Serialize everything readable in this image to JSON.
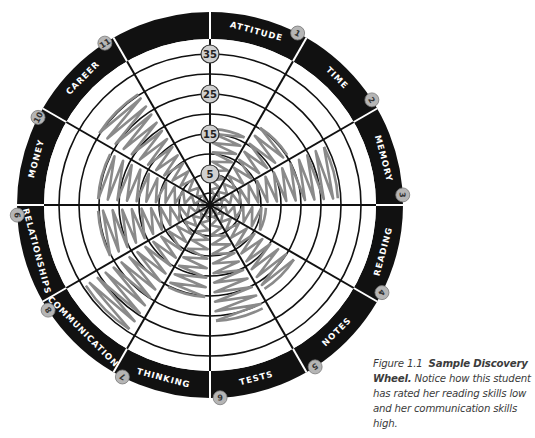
{
  "wheel": {
    "center": [
      210,
      205
    ],
    "outer_radius": 193,
    "band_inner_radius": 166,
    "ring_radii": [
      12,
      31,
      51,
      71,
      91,
      111,
      131,
      151
    ],
    "scale_labels": [
      {
        "value": "5",
        "r": 31
      },
      {
        "value": "15",
        "r": 71
      },
      {
        "value": "25",
        "r": 111
      },
      {
        "value": "35",
        "r": 151
      }
    ],
    "scribble_color": "#8a8a8a",
    "segments": [
      {
        "number": "1",
        "label": "ATTITUDE",
        "rating": 16
      },
      {
        "number": "2",
        "label": "TIME",
        "rating": 20
      },
      {
        "number": "3",
        "label": "MEMORY",
        "rating": 29
      },
      {
        "number": "4",
        "label": "READING",
        "rating": 11
      },
      {
        "number": "5",
        "label": "NOTES",
        "rating": 22
      },
      {
        "number": "6",
        "label": "TESTS",
        "rating": 26
      },
      {
        "number": "7",
        "label": "THINKING",
        "rating": 20
      },
      {
        "number": "8",
        "label": "COMMUNICATION",
        "rating": 34
      },
      {
        "number": "9",
        "label": "RELATIONSHIPS",
        "rating": 25
      },
      {
        "number": "10",
        "label": "MONEY",
        "rating": 25
      },
      {
        "number": "11",
        "label": "CAREER",
        "rating": 30
      },
      {
        "number": "12",
        "label": "",
        "rating": 0
      }
    ]
  },
  "caption": {
    "figure_number": "Figure 1.1",
    "title": "Sample Discovery Wheel.",
    "text": "Notice how this student has rated her reading skills low and her communication skills high."
  }
}
